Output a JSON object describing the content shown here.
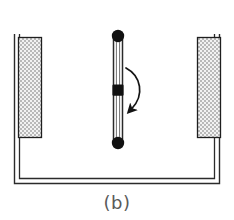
{
  "figure": {
    "caption": "(b)",
    "background_color": "#ffffff",
    "line_color": "#1a1a1a",
    "caption_color": "#5a5a5a"
  },
  "container": {
    "name": "open-top-vessel",
    "style": "double-line U-shaped cross-section",
    "outer": {
      "x": 14,
      "y": 36,
      "width": 206,
      "height": 148
    },
    "inner": {
      "x": 19,
      "y": 36,
      "width": 196,
      "height": 143
    },
    "stroke_color": "#2b2b2b",
    "fill_color": "#ffffff"
  },
  "panels": [
    {
      "name": "left-electrode-panel",
      "label": "",
      "x": 18,
      "y": 37,
      "width": 23,
      "height": 101,
      "fill": "stipple-checker",
      "fill_color": "#d4d4d4",
      "stroke_color": "#1f1f1f"
    },
    {
      "name": "right-electrode-panel",
      "label": "",
      "x": 198,
      "y": 37,
      "width": 23,
      "height": 101,
      "fill": "stipple-checker",
      "fill_color": "#d4d4d4",
      "stroke_color": "#1f1f1f"
    }
  ],
  "rod": {
    "name": "central-pivoting-rod",
    "x_center": 118,
    "y_top": 35,
    "y_bottom": 144,
    "half_width": 5,
    "stroke_color": "#2a2a2a",
    "nodes": [
      {
        "name": "top-pivot-node",
        "shape": "circle",
        "cx": 118,
        "cy": 36,
        "r": 6,
        "color": "#111111"
      },
      {
        "name": "middle-pivot-node",
        "shape": "square",
        "cx": 118,
        "cy": 90,
        "size": 11,
        "color": "#111111"
      },
      {
        "name": "bottom-pivot-node",
        "shape": "circle",
        "cx": 118,
        "cy": 143,
        "r": 6,
        "color": "#111111"
      }
    ]
  },
  "rotation_arrow": {
    "name": "rotation-direction-arrow",
    "description": "curved arrow indicating rotation of rod",
    "start": {
      "x": 126,
      "y": 68
    },
    "end": {
      "x": 130,
      "y": 111
    },
    "color": "#1a1a1a",
    "stroke_width": 1.6
  }
}
